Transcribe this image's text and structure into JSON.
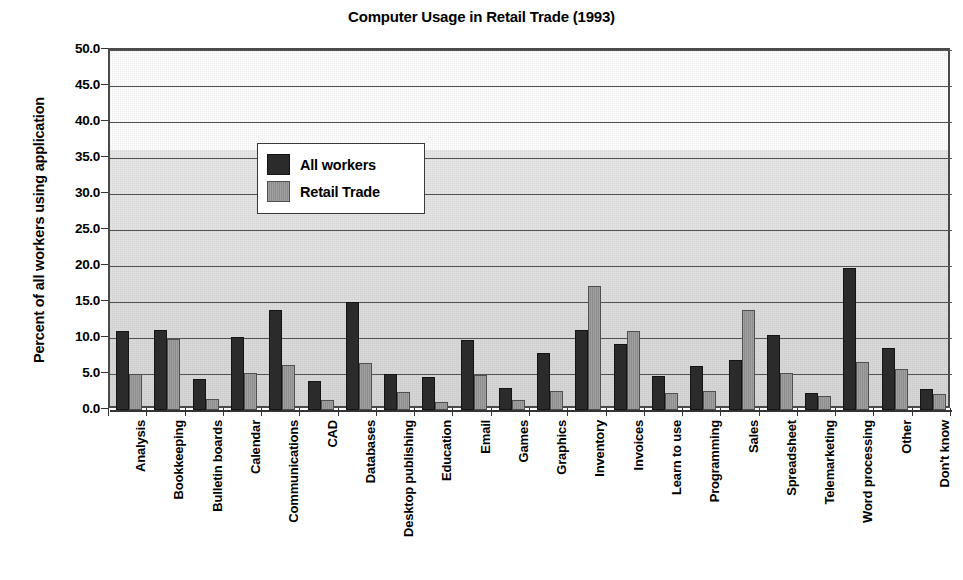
{
  "chart_data": {
    "type": "bar",
    "title": "Computer Usage in Retail Trade (1993)",
    "xlabel": "",
    "ylabel": "Percent of all workers using application",
    "ylim": [
      0.0,
      50.0
    ],
    "ytick_step": 5.0,
    "ytick_labels": [
      "50.0",
      "45.0",
      "40.0",
      "35.0",
      "30.0",
      "25.0",
      "20.0",
      "15.0",
      "10.0",
      "5.0",
      "0.0"
    ],
    "ytick_values": [
      50.0,
      45.0,
      40.0,
      35.0,
      30.0,
      25.0,
      20.0,
      15.0,
      10.0,
      5.0,
      0.0
    ],
    "grid": true,
    "legend_position": "upper-left-inside",
    "categories": [
      "Analysis",
      "Bookkeeping",
      "Bulletin boards",
      "Calendar",
      "Communications",
      "CAD",
      "Databases",
      "Desktop publishing",
      "Education",
      "Email",
      "Games",
      "Graphics",
      "Inventory",
      "Invoices",
      "Learn to use",
      "Programming",
      "Sales",
      "Spreadsheet",
      "Telemarketing",
      "Word processing",
      "Other",
      "Don't know"
    ],
    "series": [
      {
        "name": "All workers",
        "color": "#2b2b2b",
        "values": [
          11.0,
          11.1,
          4.3,
          10.1,
          13.9,
          4.0,
          15.0,
          5.0,
          4.6,
          9.7,
          3.1,
          7.9,
          11.1,
          9.2,
          4.7,
          6.1,
          6.9,
          10.4,
          2.4,
          19.7,
          8.6,
          2.9
        ]
      },
      {
        "name": "Retail Trade",
        "color": "#8e8e8e",
        "values": [
          5.0,
          9.8,
          1.5,
          5.1,
          6.2,
          1.4,
          6.5,
          2.5,
          1.1,
          4.8,
          1.4,
          2.7,
          17.2,
          11.0,
          2.4,
          2.7,
          13.9,
          5.2,
          2.0,
          6.6,
          5.7,
          2.2
        ]
      }
    ]
  },
  "legend": {
    "entries": [
      {
        "label": "All workers",
        "color": "#2b2b2b"
      },
      {
        "label": "Retail Trade",
        "color": "#8e8e8e"
      }
    ]
  }
}
